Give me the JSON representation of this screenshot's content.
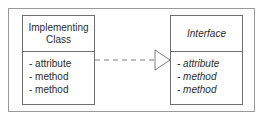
{
  "diagram": {
    "type": "uml-class-diagram",
    "relationship": "realization",
    "frame": {
      "border_color": "#9a9a9a"
    },
    "colors": {
      "box_border": "#6e6e6e",
      "box_fill": "#ffffff",
      "text": "#2b2b2b",
      "connector": "#7d7d7d",
      "background": "#ffffff"
    },
    "classes": [
      {
        "id": "implementing-class",
        "title": "Implementing Class",
        "title_italic": false,
        "members_italic": false,
        "members": [
          "- attribute",
          "- method",
          "- method"
        ]
      },
      {
        "id": "interface",
        "title": "Interface",
        "title_italic": true,
        "members_italic": true,
        "members": [
          "- attribute",
          "- method",
          "- method"
        ]
      }
    ],
    "connector": {
      "style": "dashed",
      "arrowhead": "hollow-triangle",
      "direction": "implementing-class-to-interface"
    }
  }
}
